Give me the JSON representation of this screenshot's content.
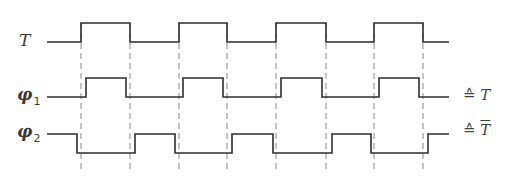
{
  "diagram": {
    "type": "timing-diagram",
    "signals": [
      {
        "name": "T",
        "label": "T",
        "subscript": "",
        "annotation": "",
        "y_high": 23,
        "y_low": 42,
        "start_x": 47,
        "end_x": 449,
        "initial": "low",
        "edges": [
          81,
          130,
          179,
          227,
          276,
          326,
          374,
          423
        ]
      },
      {
        "name": "phi1",
        "label": "φ",
        "subscript": "1",
        "annotation": "≙ T",
        "y_high": 78,
        "y_low": 97,
        "start_x": 47,
        "end_x": 449,
        "initial": "low",
        "edges": [
          86,
          126,
          183,
          223,
          281,
          322,
          379,
          419
        ]
      },
      {
        "name": "phi2",
        "label": "φ",
        "subscript": "2",
        "annotation": "≙ T̄",
        "y_high": 134,
        "y_low": 153,
        "start_x": 47,
        "end_x": 449,
        "initial": "high",
        "edges": [
          77,
          135,
          175,
          232,
          273,
          332,
          371,
          428
        ]
      }
    ],
    "guides": {
      "x": [
        81,
        130,
        179,
        227,
        276,
        326,
        374,
        423
      ],
      "y_top": 23,
      "y_bottom": 170
    },
    "labels": {
      "T": "T",
      "phi": "φ",
      "phi1_sub": "1",
      "phi2_sub": "2",
      "equiv_symbol": "≙",
      "annot1_var": "T",
      "annot2_var": "T"
    },
    "colors": {
      "line": "#2e2e2e",
      "guide": "#8a8a8a",
      "text": "#3a3a3a"
    }
  }
}
